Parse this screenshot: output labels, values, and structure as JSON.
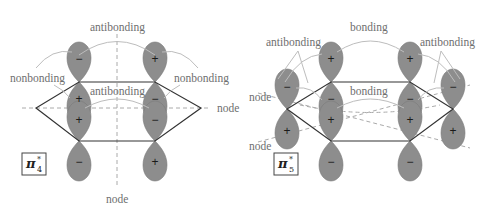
{
  "panels": [
    {
      "id": "pi4",
      "orbital_label": {
        "symbol": "π",
        "superscript": "*",
        "subscript": "4"
      },
      "labels": {
        "antibonding_top": "antibonding",
        "nonbonding_left": "nonbonding",
        "nonbonding_right": "nonbonding",
        "antibonding_mid": "antibonding",
        "node_right": "node",
        "node_bottom": "node"
      },
      "signs": {
        "top_left": "−",
        "top_right": "+",
        "upper_mid_left": "+",
        "upper_mid_right": "−",
        "lower_mid_left": "+",
        "lower_mid_right": "−",
        "bottom_left": "−",
        "bottom_right": "+"
      }
    },
    {
      "id": "pi5",
      "orbital_label": {
        "symbol": "π",
        "superscript": "*",
        "subscript": "5"
      },
      "labels": {
        "bonding_top": "bonding",
        "antibonding_left": "antibonding",
        "antibonding_right": "antibonding",
        "bonding_mid": "bonding",
        "node_left_upper": "node",
        "node_left_lower": "node"
      },
      "signs": {
        "outer_left_top": "−",
        "outer_left_bottom": "+",
        "top_left": "+",
        "top_right": "+",
        "upper_mid_left": "−",
        "upper_mid_right": "−",
        "lower_mid_left": "+",
        "lower_mid_right": "+",
        "bottom_left": "−",
        "bottom_right": "−",
        "outer_right_top": "−",
        "outer_right_bottom": "+"
      }
    }
  ]
}
